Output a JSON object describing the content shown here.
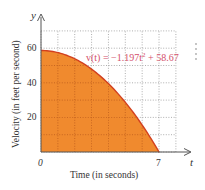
{
  "chart_data": {
    "type": "area",
    "title": "",
    "xlabel": "Time (in seconds)",
    "ylabel": "Velocity (in feet per second)",
    "x_axis_symbol": "t",
    "y_axis_symbol": "y",
    "x_ticks": [
      {
        "value": 0,
        "label": "0"
      },
      {
        "value": 7,
        "label": "7"
      }
    ],
    "y_ticks": [
      {
        "value": 20,
        "label": "20"
      },
      {
        "value": 40,
        "label": "40"
      },
      {
        "value": 60,
        "label": "60"
      }
    ],
    "xlim": [
      0,
      8
    ],
    "ylim": [
      0,
      70
    ],
    "grid": true,
    "grid_step_x": 1,
    "grid_step_y": 10,
    "legend": null,
    "annotation": "v(t) = −1.197t² + 58.67",
    "function": {
      "a": -1.197,
      "c": 58.67,
      "t_start": 0,
      "t_end": 7
    },
    "series": [
      {
        "name": "v(t)",
        "x": [
          0,
          1,
          2,
          3,
          4,
          5,
          6,
          7
        ],
        "values": [
          58.67,
          57.47,
          53.88,
          47.9,
          39.52,
          28.75,
          15.58,
          0.02
        ]
      }
    ],
    "colors": {
      "fill": "#f08a2e",
      "curve": "#d2401f",
      "annotation": "#d4506a",
      "axis": "#555555"
    }
  },
  "labels": {
    "y_symbol": "y",
    "t_symbol": "t",
    "origin": "0",
    "x_tick_7": "7",
    "y_tick_20": "20",
    "y_tick_40": "40",
    "y_tick_60": "60",
    "equation_prefix": "v(t) = −1.197t",
    "equation_exp": "2",
    "equation_suffix": " + 58.67",
    "xlabel": "Time (in seconds)",
    "ylabel": "Velocity (in feet per second)"
  }
}
